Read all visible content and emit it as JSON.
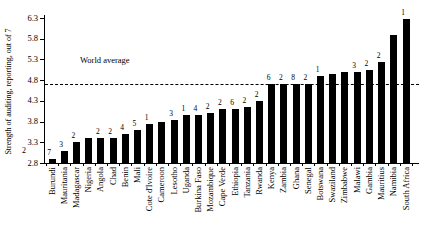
{
  "figure": {
    "background": "#ffffff",
    "bar_color": "#000000",
    "axis_color": "#000000"
  },
  "chart_data": {
    "type": "bar",
    "title": "",
    "xlabel": "",
    "ylabel": "Strength of auditing, reporting, out of 7",
    "ylim": [
      2.8,
      6.3
    ],
    "yticks": [
      "2.8",
      "3.3",
      "3.8",
      "4.3",
      "4.8",
      "5.3",
      "5.8",
      "6.3"
    ],
    "stray_axis_label": "2",
    "grid": "off",
    "legend": "none",
    "world_average": {
      "label": "World average",
      "value": 4.7
    },
    "categories": [
      "Burundi",
      "Mauritania",
      "Madagascar",
      "Nigeria",
      "Angola",
      "Chad",
      "Benin",
      "Mali",
      "Cote d'Ivoire",
      "Cameroon",
      "Lesotho",
      "Uganda",
      "Burkina Faso",
      "Mozambique",
      "Cape Verde",
      "Ethiopia",
      "Tanzania",
      "Rwanda",
      "Kenya",
      "Zambia",
      "Ghana",
      "Senegal",
      "Botswana",
      "Swaziland",
      "Zimbabwe",
      "Malawi",
      "Gambia",
      "Mauritius",
      "Namibia",
      "South Africa"
    ],
    "values": [
      2.9,
      3.1,
      3.3,
      3.4,
      3.4,
      3.4,
      3.5,
      3.6,
      3.75,
      3.8,
      3.85,
      3.95,
      3.95,
      4.0,
      4.1,
      4.1,
      4.15,
      4.3,
      4.7,
      4.7,
      4.7,
      4.7,
      4.9,
      4.95,
      5.0,
      5.0,
      5.05,
      5.25,
      5.9,
      6.27
    ],
    "bar_labels": [
      "7",
      "3",
      "2",
      "",
      "2",
      "2",
      "4",
      "5",
      "1",
      "",
      "3",
      "1",
      "4",
      "2",
      "2",
      "6",
      "2",
      "2",
      "6",
      "2",
      "8",
      "2",
      "1",
      "",
      "",
      "3",
      "2",
      "2",
      "",
      "1"
    ]
  }
}
